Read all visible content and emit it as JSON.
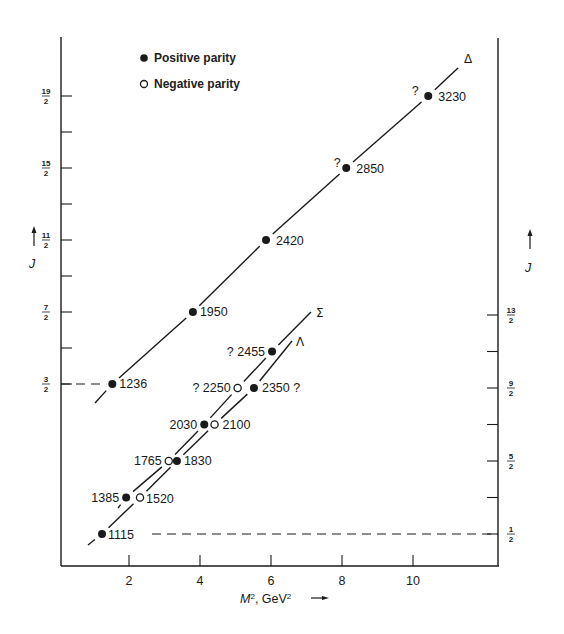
{
  "chart_data": {
    "type": "scatter",
    "title": "",
    "xlabel": "M², GeV²",
    "ylabel_left": "J",
    "ylabel_right": "J",
    "xlim": [
      0,
      12.2
    ],
    "x_ticks": [
      2,
      4,
      6,
      8,
      10
    ],
    "left_y_ticks": [
      "19/2",
      "",
      "15/2",
      "",
      "11/2",
      "",
      "7/2",
      "",
      "3/2"
    ],
    "left_y_tick_values": [
      9.5,
      8.5,
      7.5,
      6.5,
      5.5,
      4.5,
      3.5,
      2.5,
      1.5
    ],
    "right_y_ticks": [
      "13/2",
      "",
      "9/2",
      "",
      "5/2",
      "",
      "1/2"
    ],
    "right_y_tick_values": [
      6.5,
      5.5,
      4.5,
      3.5,
      2.5,
      1.5,
      0.5
    ],
    "grid": false,
    "legend": {
      "position": "top-left",
      "entries": [
        {
          "marker": "filled-circle",
          "label": "Positive parity"
        },
        {
          "marker": "open-circle",
          "label": "Negative parity"
        }
      ]
    },
    "series": [
      {
        "name": "Δ",
        "axis": "left",
        "points": [
          {
            "mass": "1236",
            "m2": 1.53,
            "J": 1.5,
            "parity": "+",
            "uncertain": false
          },
          {
            "mass": "1950",
            "m2": 3.8,
            "J": 3.5,
            "parity": "+",
            "uncertain": false
          },
          {
            "mass": "2420",
            "m2": 5.86,
            "J": 5.5,
            "parity": "+",
            "uncertain": false
          },
          {
            "mass": "2850",
            "m2": 8.12,
            "J": 7.5,
            "parity": "+",
            "uncertain": true
          },
          {
            "mass": "3230",
            "m2": 10.43,
            "J": 9.5,
            "parity": "+",
            "uncertain": true
          }
        ]
      },
      {
        "name": "Σ",
        "axis": "right",
        "points": [
          {
            "mass": "1385",
            "m2": 1.92,
            "J": 1.5,
            "parity": "+",
            "uncertain": false
          },
          {
            "mass": "1765",
            "m2": 3.12,
            "J": 2.5,
            "parity": "-",
            "uncertain": false
          },
          {
            "mass": "2030",
            "m2": 4.12,
            "J": 3.5,
            "parity": "+",
            "uncertain": false
          },
          {
            "mass": "2250",
            "m2": 5.06,
            "J": 4.5,
            "parity": "-",
            "uncertain": true
          },
          {
            "mass": "2455",
            "m2": 6.03,
            "J": 5.5,
            "parity": "+",
            "uncertain": true
          }
        ]
      },
      {
        "name": "Λ",
        "axis": "right",
        "points": [
          {
            "mass": "1115",
            "m2": 1.24,
            "J": 0.5,
            "parity": "+",
            "uncertain": false
          },
          {
            "mass": "1520",
            "m2": 2.31,
            "J": 1.5,
            "parity": "-",
            "uncertain": false
          },
          {
            "mass": "1830",
            "m2": 3.35,
            "J": 2.5,
            "parity": "+",
            "uncertain": false
          },
          {
            "mass": "2100",
            "m2": 4.41,
            "J": 3.5,
            "parity": "-",
            "uncertain": false
          },
          {
            "mass": "2350",
            "m2": 5.52,
            "J": 4.5,
            "parity": "+",
            "uncertain": true
          }
        ]
      }
    ],
    "reference_lines": [
      {
        "style": "dashed",
        "from": "left axis",
        "to": "1236",
        "J": 1.5
      },
      {
        "style": "dashed",
        "from": "1115",
        "to": "right axis",
        "J": 0.5
      }
    ]
  },
  "layout": {
    "plot": {
      "x0": 61,
      "x1": 499,
      "y_top": 37,
      "y_bottom": 566
    },
    "px_per_m2": 35.5,
    "x_origin": 58,
    "left_scale": {
      "y_at_1_5": 384,
      "px_per_J": 36
    },
    "right_scale": {
      "y_at_0_5": 534,
      "px_per_J": 36.5
    }
  },
  "labels": {
    "x_axis_title": "M², GeV²",
    "y_axis_left": "J",
    "y_axis_right": "J",
    "legend_positive": "Positive parity",
    "legend_negative": "Negative parity",
    "delta": "Δ",
    "sigma": "Σ",
    "lambda": "Λ",
    "question": "?"
  }
}
